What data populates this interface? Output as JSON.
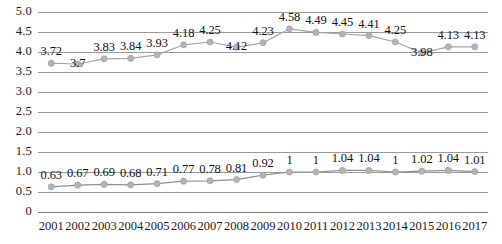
{
  "chart_data": {
    "type": "line",
    "title": "",
    "subtitle": "",
    "xlabel": "",
    "ylabel": "",
    "ylim": [
      0,
      5.0
    ],
    "grid": true,
    "legend_position": "none",
    "categories": [
      "2001",
      "2002",
      "2003",
      "2004",
      "2005",
      "2006",
      "2007",
      "2008",
      "2009",
      "2010",
      "2011",
      "2012",
      "2013",
      "2014",
      "2015",
      "2016",
      "2017"
    ],
    "y_ticks": [
      "0",
      "0.5",
      "1.0",
      "1.5",
      "2.0",
      "2.5",
      "3.0",
      "3.5",
      "4.0",
      "4.5",
      "5.0"
    ],
    "y_tick_values": [
      0,
      0.5,
      1.0,
      1.5,
      2.0,
      2.5,
      3.0,
      3.5,
      4.0,
      4.5,
      5.0
    ],
    "series": [
      {
        "name": "upper-series",
        "color": "#a6a6a6",
        "marker_color": "#b3b3b3",
        "values": [
          3.72,
          3.7,
          3.83,
          3.84,
          3.93,
          4.18,
          4.25,
          4.12,
          4.23,
          4.58,
          4.49,
          4.45,
          4.41,
          4.25,
          3.98,
          4.13,
          4.13
        ],
        "labels": [
          "3.72",
          "3.7",
          "3.83",
          "3.84",
          "3.93",
          "4.18",
          "4.25",
          "4.12",
          "4.23",
          "4.58",
          "4.49",
          "4.45",
          "4.41",
          "4.25",
          "3.98",
          "4.13",
          "4.13"
        ],
        "label_offsets": [
          0,
          1,
          0,
          0,
          0,
          0,
          0,
          1,
          0,
          0,
          0,
          0,
          0,
          0,
          1,
          0,
          0
        ]
      },
      {
        "name": "lower-series",
        "color": "#8f8f8f",
        "marker_color": "#b3b3b3",
        "values": [
          0.63,
          0.67,
          0.69,
          0.68,
          0.71,
          0.77,
          0.78,
          0.81,
          0.92,
          1,
          1,
          1.04,
          1.04,
          1,
          1.02,
          1.04,
          1.01
        ],
        "labels": [
          "0.63",
          "0.67",
          "0.69",
          "0.68",
          "0.71",
          "0.77",
          "0.78",
          "0.81",
          "0.92",
          "1",
          "1",
          "1.04",
          "1.04",
          "1",
          "1.02",
          "1.04",
          "1.01"
        ],
        "label_offsets": [
          0,
          0,
          0,
          0,
          0,
          0,
          0,
          0,
          0,
          0,
          0,
          0,
          0,
          0,
          0,
          0,
          0
        ]
      }
    ]
  },
  "colors": {
    "gridline": "#9a9a9a",
    "text": "#1a1a1a",
    "plot_background": "#ffffff"
  }
}
